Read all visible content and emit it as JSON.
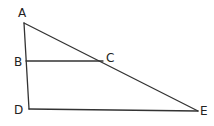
{
  "diagram": {
    "type": "geometry",
    "points": {
      "A": {
        "label": "A",
        "x": 24,
        "y": 23
      },
      "B": {
        "label": "B",
        "x": 26,
        "y": 61
      },
      "C": {
        "label": "C",
        "x": 103,
        "y": 61
      },
      "D": {
        "label": "D",
        "x": 29,
        "y": 109
      },
      "E": {
        "label": "E",
        "x": 198,
        "y": 111
      }
    },
    "segments": [
      "AD",
      "AE",
      "BC",
      "DE"
    ]
  }
}
